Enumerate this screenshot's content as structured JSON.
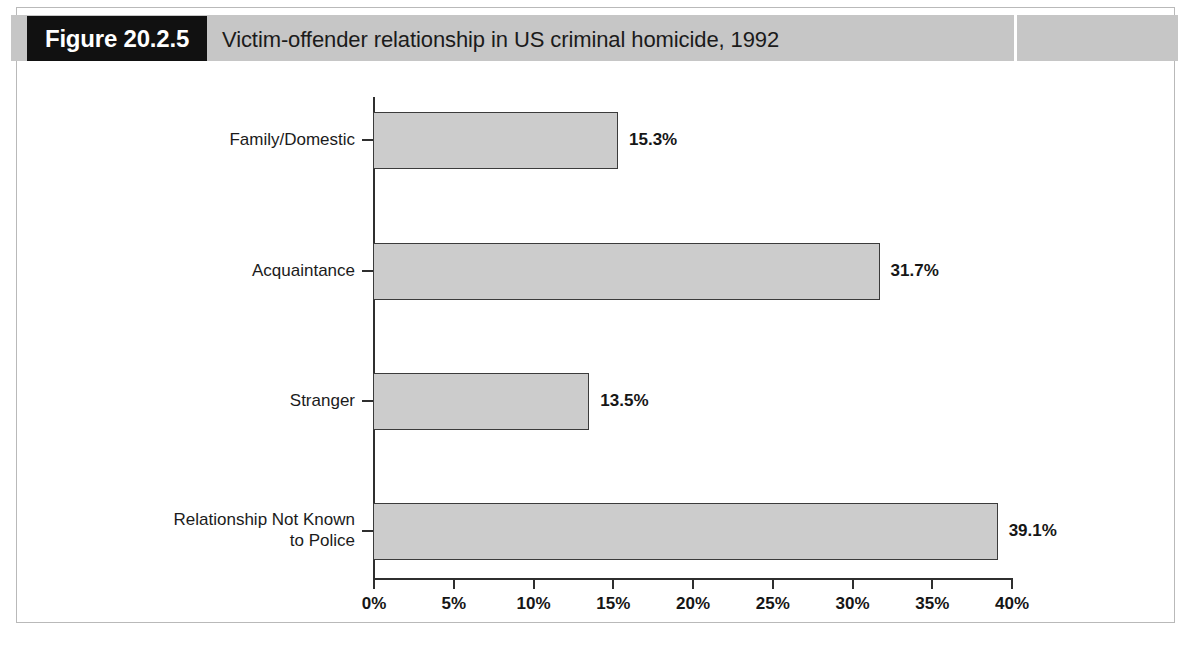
{
  "figure": {
    "label": "Figure 20.2.5",
    "title": "Victim-offender relationship in US criminal homicide, 1992"
  },
  "colors": {
    "header_band": "#c6c6c6",
    "label_box": "#111111",
    "bar_fill": "#cccccc",
    "bar_stroke": "#3b3b3b",
    "axis": "#2f2f2f",
    "frame": "#b9b9b9"
  },
  "chart_data": {
    "type": "bar",
    "orientation": "horizontal",
    "title": "Victim-offender relationship in US criminal homicide, 1992",
    "xlabel": "",
    "ylabel": "",
    "categories": [
      "Family/Domestic",
      "Acquaintance",
      "Stranger",
      "Relationship Not Known\nto Police"
    ],
    "values": [
      15.3,
      31.7,
      13.5,
      39.1
    ],
    "value_labels": [
      "15.3%",
      "31.7%",
      "13.5%",
      "39.1%"
    ],
    "xlim": [
      0,
      40
    ],
    "xticks": [
      0,
      5,
      10,
      15,
      20,
      25,
      30,
      35,
      40
    ],
    "xtick_labels": [
      "0%",
      "5%",
      "10%",
      "15%",
      "20%",
      "25%",
      "30%",
      "35%",
      "40%"
    ],
    "grid": false,
    "legend": false
  }
}
